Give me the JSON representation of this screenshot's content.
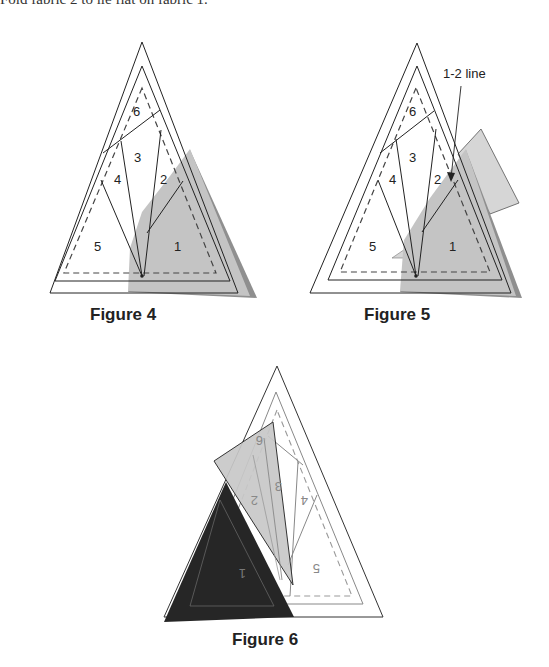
{
  "header": {
    "instruction_text": "Fold fabric 2 to lie flat on fabric 1."
  },
  "figures": [
    {
      "caption": "Figure 4",
      "section_labels": [
        "6",
        "3",
        "4",
        "2",
        "5",
        "1"
      ]
    },
    {
      "caption": "Figure 5",
      "annotation": "1-2 line",
      "section_labels": [
        "6",
        "3",
        "4",
        "2",
        "5",
        "1"
      ]
    },
    {
      "caption": "Figure 6",
      "section_labels": [
        "6",
        "3",
        "2",
        "4",
        "1",
        "5"
      ]
    }
  ],
  "colors": {
    "fabric_gray": "#c4c4c4",
    "fabric_edge": "#8f8f8f",
    "fabric_light": "#d6d6d6",
    "fabric_dark": "#262626",
    "line": "#222222"
  }
}
